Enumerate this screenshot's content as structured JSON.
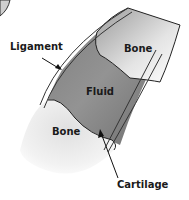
{
  "diagram": {
    "type": "joint-cross-section",
    "labels": {
      "ligament": "Ligament",
      "bone_top": "Bone",
      "fluid": "Fluid",
      "bone_bottom": "Bone",
      "cartilage": "Cartilage"
    },
    "colors": {
      "fluid": "#8a8a8a",
      "bone": "#d6d6d6",
      "outline": "#222222"
    }
  }
}
